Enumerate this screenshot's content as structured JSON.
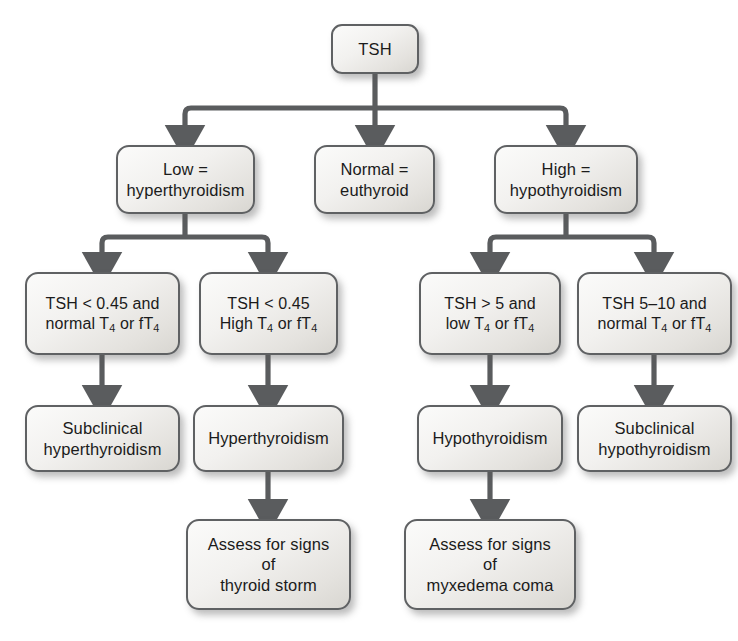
{
  "diagram": {
    "type": "flowchart",
    "orientation": "top-down",
    "style": {
      "box_border_color": "#5f6163",
      "box_fill_light": "#fbfbfa",
      "box_fill_dark": "#d8d6d1",
      "connector_color": "#5a5c5e",
      "text_color": "#1b1b1b",
      "background": "#ffffff"
    },
    "nodes": {
      "root": {
        "label": "TSH"
      },
      "low": {
        "line1": "Low =",
        "line2": "hyperthyroidism",
        "label": "Low =\nhyperthyroidism"
      },
      "normal": {
        "line1": "Normal =",
        "line2": "euthyroid",
        "label": "Normal =\neuthyroid"
      },
      "high": {
        "line1": "High =",
        "line2": "hypothyroidism",
        "label": "High =\nhypothyroidism"
      },
      "cond_low_normal_t4": {
        "line1": "TSH < 0.45 and",
        "line2_pre": "normal T",
        "line2_sub1": "4",
        "line2_mid": " or fT",
        "line2_sub2": "4"
      },
      "cond_low_high_t4": {
        "line1": "TSH < 0.45",
        "line2_pre": "High T",
        "line2_sub1": "4",
        "line2_mid": " or fT",
        "line2_sub2": "4"
      },
      "cond_high_low_t4": {
        "line1": "TSH > 5 and",
        "line2_pre": "low T",
        "line2_sub1": "4",
        "line2_mid": " or fT",
        "line2_sub2": "4"
      },
      "cond_high_normal_t4": {
        "line1": "TSH 5–10 and",
        "line2_pre": "normal T",
        "line2_sub1": "4",
        "line2_mid": " or fT",
        "line2_sub2": "4"
      },
      "subclinical_hyper": {
        "line1": "Subclinical",
        "line2": "hyperthyroidism",
        "label": "Subclinical\nhyperthyroidism"
      },
      "hyperthyroidism": {
        "label": "Hyperthyroidism"
      },
      "hypothyroidism": {
        "label": "Hypothyroidism"
      },
      "subclinical_hypo": {
        "line1": "Subclinical",
        "line2": "hypothyroidism",
        "label": "Subclinical\nhypothyroidism"
      },
      "assess_thyroid_storm": {
        "line1": "Assess for signs",
        "line2": "of",
        "line3": "thyroid storm",
        "label": "Assess for signs\nof\nthyroid storm"
      },
      "assess_myxedema": {
        "line1": "Assess for signs",
        "line2": "of",
        "line3": "myxedema coma",
        "label": "Assess for signs\nof\nmyxedema coma"
      }
    },
    "edges": [
      {
        "from": "root",
        "to": "low"
      },
      {
        "from": "root",
        "to": "normal"
      },
      {
        "from": "root",
        "to": "high"
      },
      {
        "from": "low",
        "to": "cond_low_normal_t4"
      },
      {
        "from": "low",
        "to": "cond_low_high_t4"
      },
      {
        "from": "high",
        "to": "cond_high_low_t4"
      },
      {
        "from": "high",
        "to": "cond_high_normal_t4"
      },
      {
        "from": "cond_low_normal_t4",
        "to": "subclinical_hyper"
      },
      {
        "from": "cond_low_high_t4",
        "to": "hyperthyroidism"
      },
      {
        "from": "cond_high_low_t4",
        "to": "hypothyroidism"
      },
      {
        "from": "cond_high_normal_t4",
        "to": "subclinical_hypo"
      },
      {
        "from": "hyperthyroidism",
        "to": "assess_thyroid_storm"
      },
      {
        "from": "hypothyroidism",
        "to": "assess_myxedema"
      }
    ]
  }
}
